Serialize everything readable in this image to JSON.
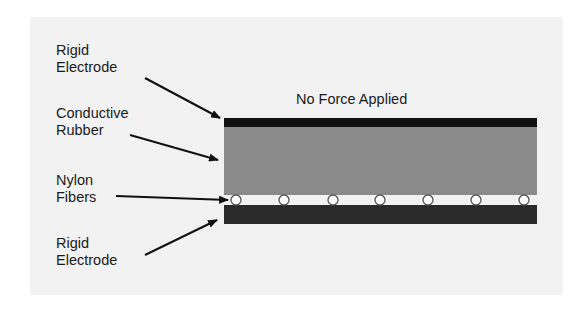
{
  "title": "No Force Applied",
  "labels": {
    "top_electrode": "Rigid\nElectrode",
    "rubber": "Conductive\nRubber",
    "fibers": "Nylon\nFibers",
    "bottom_electrode": "Rigid\nElectrode"
  },
  "colors": {
    "panel": "#f2f2f2",
    "electrode_top": "#111111",
    "rubber": "#8a8a8a",
    "electrode_bottom": "#2a2a2a",
    "fiber_fill": "#ffffff",
    "fiber_stroke": "#555555",
    "arrow": "#111111"
  },
  "layers": [
    {
      "name": "Rigid Electrode (top)"
    },
    {
      "name": "Conductive Rubber"
    },
    {
      "name": "Nylon Fibers",
      "count": 7
    },
    {
      "name": "Rigid Electrode (bottom)"
    }
  ]
}
